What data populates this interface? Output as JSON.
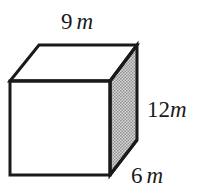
{
  "figure": {
    "name": "rectangular-prism",
    "shape_type": "rectangular prism",
    "background_color": "#ffffff",
    "stroke_color": "#1a1a1a",
    "stroke_width": 3,
    "front_face_color": "#ffffff",
    "top_face_color": "#ffffff",
    "side_face_color": "#b4b4b4",
    "side_face_pattern": "halftone-dots"
  },
  "labels": {
    "top": {
      "name": "width-label",
      "value": "9",
      "unit": "m",
      "full_text": "9 m",
      "edge": "top-front-horizontal"
    },
    "right": {
      "name": "height-label",
      "value": "12",
      "unit": "m",
      "full_text": "12m",
      "edge": "right-vertical"
    },
    "bottom": {
      "name": "depth-label",
      "value": "6",
      "unit": "m",
      "full_text": "6 m",
      "edge": "bottom-right-diagonal"
    }
  }
}
